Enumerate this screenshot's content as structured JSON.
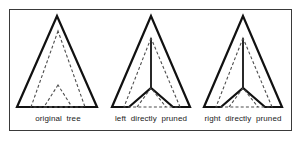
{
  "figure": {
    "background_color": "#ffffff",
    "frame": {
      "stroke_color": "#3a3a3a",
      "stroke_width": 1,
      "x": 9,
      "y": 9,
      "width": 283,
      "height": 122
    },
    "solid_stroke_color": "#111111",
    "dashed_stroke_color": "#4d4d4d",
    "solid_stroke_width": 2.2,
    "dashed_stroke_width": 1.1,
    "dash_pattern": "3,2.2"
  },
  "panels": [
    {
      "id": "original-tree",
      "caption": "original  tree",
      "shapes": {
        "outer_triangle": {
          "type": "solid-triangle",
          "apex": [
            57,
            16
          ],
          "base_left": [
            17,
            107
          ],
          "base_right": [
            97,
            107
          ]
        },
        "inner_dashed_triangle": {
          "type": "dashed-triangle",
          "apex": [
            58,
            31
          ],
          "base_left": [
            31,
            107
          ],
          "base_right": [
            85,
            107
          ]
        },
        "small_dashed_triangle": {
          "type": "dashed-triangle",
          "apex": [
            58,
            85
          ],
          "base_left": [
            44,
            107
          ],
          "base_right": [
            72,
            107
          ]
        }
      }
    },
    {
      "id": "left-directly-pruned",
      "caption": "left  directly  pruned",
      "shapes": {
        "outer_notched_triangle": {
          "type": "solid-notched-triangle",
          "apex": [
            151,
            16
          ],
          "base_left": [
            112,
            107
          ],
          "notch_left": [
            129,
            107
          ],
          "notch_vertex": [
            151,
            88
          ],
          "notch_right": [
            173,
            107
          ],
          "base_right": [
            190,
            107
          ]
        },
        "stem_line": {
          "type": "solid-line",
          "from": [
            151,
            38
          ],
          "to": [
            151,
            88
          ]
        },
        "inner_dashed_triangle": {
          "type": "dashed-triangle",
          "apex": [
            151,
            38
          ],
          "base_left": [
            124,
            107
          ],
          "base_right": [
            180,
            107
          ]
        },
        "small_dashed_triangle": {
          "type": "dashed-triangle",
          "apex": [
            151,
            88
          ],
          "base_left": [
            137,
            107
          ],
          "base_right": [
            166,
            107
          ]
        }
      }
    },
    {
      "id": "right-directly-pruned",
      "caption": "right  directly  pruned",
      "shapes": {
        "outer_notched_triangle": {
          "type": "solid-notched-triangle",
          "apex": [
            243,
            16
          ],
          "base_left": [
            204,
            107
          ],
          "notch_left": [
            221,
            107
          ],
          "notch_vertex": [
            243,
            88
          ],
          "notch_right": [
            265,
            107
          ],
          "base_right": [
            282,
            107
          ]
        },
        "stem_line": {
          "type": "solid-line",
          "from": [
            243,
            38
          ],
          "to": [
            243,
            88
          ]
        },
        "inner_dashed_triangle": {
          "type": "dashed-triangle",
          "apex": [
            243,
            38
          ],
          "base_left": [
            216,
            107
          ],
          "base_right": [
            272,
            107
          ]
        },
        "small_dashed_triangle": {
          "type": "dashed-triangle",
          "apex": [
            243,
            88
          ],
          "base_left": [
            229,
            107
          ],
          "base_right": [
            258,
            107
          ]
        }
      }
    }
  ]
}
